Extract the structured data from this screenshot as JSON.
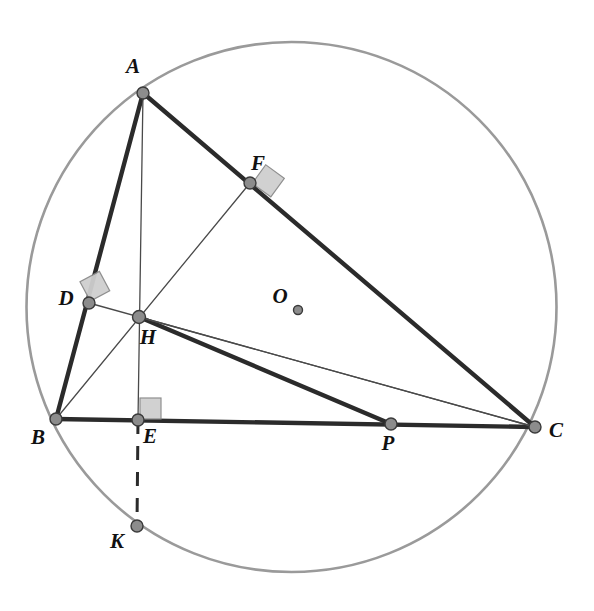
{
  "figure": {
    "canvas": {
      "width": 594,
      "height": 611,
      "background": "#ffffff"
    },
    "colors": {
      "circle_stroke": "#9a9a9a",
      "thick_line": "#2b2b2b",
      "thin_line": "#4a4a4a",
      "dashed_line": "#2b2b2b",
      "vertex_fill": "#8c8c8c",
      "vertex_stroke": "#3a3a3a",
      "right_angle_fill": "#cfcfcf",
      "right_angle_stroke": "#8a8a8a",
      "label_color": "#111111"
    },
    "circle": {
      "cx": 291.5,
      "cy": 307,
      "r": 265,
      "stroke_width": 2.6
    },
    "points": [
      {
        "id": "A",
        "label": "A",
        "x": 143,
        "y": 93,
        "lx": 133,
        "ly": 73,
        "r": 6.0,
        "marker": true
      },
      {
        "id": "B",
        "label": "B",
        "x": 56,
        "y": 419,
        "lx": 38,
        "ly": 444,
        "r": 6.0,
        "marker": true
      },
      {
        "id": "C",
        "label": "C",
        "x": 535,
        "y": 427,
        "lx": 556,
        "ly": 437,
        "r": 6.0,
        "marker": true
      },
      {
        "id": "D",
        "label": "D",
        "x": 89,
        "y": 303,
        "lx": 66,
        "ly": 305,
        "r": 6.0,
        "marker": true
      },
      {
        "id": "E",
        "label": "E",
        "x": 138,
        "y": 420,
        "lx": 150,
        "ly": 443,
        "r": 6.0,
        "marker": true
      },
      {
        "id": "F",
        "label": "F",
        "x": 250,
        "y": 183,
        "lx": 258,
        "ly": 170,
        "r": 6.0,
        "marker": true
      },
      {
        "id": "H",
        "label": "H",
        "x": 139,
        "y": 317,
        "lx": 148,
        "ly": 344,
        "r": 6.5,
        "marker": true
      },
      {
        "id": "P",
        "label": "P",
        "x": 391,
        "y": 424,
        "lx": 388,
        "ly": 450,
        "r": 6.0,
        "marker": true
      },
      {
        "id": "K",
        "label": "K",
        "x": 137,
        "y": 526,
        "lx": 117,
        "ly": 548,
        "r": 6.0,
        "marker": true
      },
      {
        "id": "O",
        "label": "O",
        "x": 298,
        "y": 310,
        "lx": 280,
        "ly": 303,
        "r": 4.5,
        "marker": true
      }
    ],
    "segments": [
      {
        "id": "AB",
        "from": "A",
        "to": "B",
        "style": "thick"
      },
      {
        "id": "AC",
        "from": "A",
        "to": "C",
        "style": "thick"
      },
      {
        "id": "BC",
        "from": "B",
        "to": "C",
        "style": "thick"
      },
      {
        "id": "HP",
        "from": "H",
        "to": "P",
        "style": "thick"
      },
      {
        "id": "AE",
        "from": "A",
        "to": "E",
        "style": "thin"
      },
      {
        "id": "BF",
        "from": "B",
        "to": "F",
        "style": "thin"
      },
      {
        "id": "CD",
        "from": "C",
        "to": "D",
        "style": "thin"
      },
      {
        "id": "HC",
        "from": "H",
        "to": "C",
        "style": "thin"
      },
      {
        "id": "EK",
        "from": "E",
        "to": "K",
        "style": "dashed"
      }
    ],
    "right_angles": [
      {
        "id": "right-angle-at-D",
        "at": "D",
        "size": 22,
        "rotation": -28
      },
      {
        "id": "right-angle-at-E",
        "at": "E",
        "size": 21,
        "rotation": 0
      },
      {
        "id": "right-angle-at-F",
        "at": "F",
        "size": 23,
        "rotation": 36
      }
    ],
    "line_widths": {
      "thick": 4.4,
      "thin": 1.3,
      "dashed": 3.0
    },
    "dash_pattern": "14 12"
  }
}
